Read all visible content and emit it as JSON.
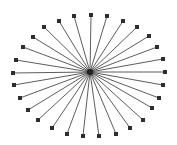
{
  "diagram": {
    "type": "star-graph",
    "width": 177,
    "height": 145,
    "background": "#ffffff",
    "edge_color": "#4a4a4a",
    "edge_width": 0.9,
    "node_color": "#2e2e2e",
    "node_size": 4,
    "hub": {
      "x": 90,
      "y": 72
    },
    "leaves": [
      {
        "x": 91,
        "y": 15
      },
      {
        "x": 107,
        "y": 16
      },
      {
        "x": 123,
        "y": 21
      },
      {
        "x": 137,
        "y": 27
      },
      {
        "x": 149,
        "y": 36
      },
      {
        "x": 157,
        "y": 47
      },
      {
        "x": 163,
        "y": 59
      },
      {
        "x": 165,
        "y": 72
      },
      {
        "x": 163,
        "y": 85
      },
      {
        "x": 159,
        "y": 98
      },
      {
        "x": 152,
        "y": 108
      },
      {
        "x": 143,
        "y": 120
      },
      {
        "x": 130,
        "y": 128
      },
      {
        "x": 116,
        "y": 134
      },
      {
        "x": 99,
        "y": 136
      },
      {
        "x": 83,
        "y": 136
      },
      {
        "x": 67,
        "y": 134
      },
      {
        "x": 52,
        "y": 128
      },
      {
        "x": 38,
        "y": 120
      },
      {
        "x": 28,
        "y": 110
      },
      {
        "x": 20,
        "y": 98
      },
      {
        "x": 14,
        "y": 85
      },
      {
        "x": 13,
        "y": 73
      },
      {
        "x": 16,
        "y": 60
      },
      {
        "x": 23,
        "y": 47
      },
      {
        "x": 33,
        "y": 37
      },
      {
        "x": 44,
        "y": 27
      },
      {
        "x": 59,
        "y": 21
      },
      {
        "x": 74,
        "y": 16
      }
    ]
  }
}
